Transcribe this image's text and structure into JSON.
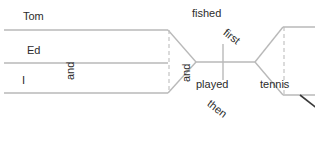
{
  "diagram": {
    "type": "sentence-diagram",
    "sentence": "Tom, Ed, and I fished first and then played tennis.",
    "colors": {
      "solid_line": "#b9b9b9",
      "dashed_line": "#c4c4c4",
      "diagonal_line": "#3a3a3a",
      "text": "#2b2b2b",
      "background": "#ffffff"
    },
    "subjects": {
      "conjunction": "and",
      "items": [
        {
          "id": "subject-tom",
          "label": "Tom"
        },
        {
          "id": "subject-ed",
          "label": "Ed"
        },
        {
          "id": "subject-i",
          "label": "I"
        }
      ]
    },
    "predicates": {
      "conjunction": "and",
      "items": [
        {
          "id": "predicate-fished",
          "verb": "fished",
          "modifier": "first",
          "object": ""
        },
        {
          "id": "predicate-played",
          "verb": "played",
          "modifier": "then",
          "object": "tennis"
        }
      ]
    }
  }
}
